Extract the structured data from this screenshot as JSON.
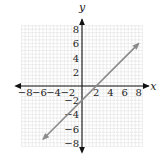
{
  "chart_data": {
    "type": "line",
    "title": "",
    "xlabel": "x",
    "ylabel": "y",
    "xlim": [
      -8.5,
      8.5
    ],
    "ylim": [
      -8.5,
      8.5
    ],
    "grid": true,
    "x_ticks": [
      -8,
      -6,
      -4,
      -2,
      2,
      4,
      6,
      8
    ],
    "y_ticks": [
      8,
      6,
      4,
      2,
      -2,
      -4,
      -6,
      -8
    ],
    "x_tick_labels": [
      "−8",
      "−6",
      "−4",
      "−2",
      "2",
      "4",
      "6",
      "8"
    ],
    "y_tick_labels": [
      "8",
      "6",
      "4",
      "2",
      "−2",
      "−4",
      "−6",
      "−8"
    ],
    "series": [
      {
        "name": "y = x − 2",
        "equation": "y = x - 2",
        "x": [
          -5.5,
          8
        ],
        "y": [
          -7.5,
          6
        ],
        "arrows": "both",
        "color": "#8a8a8a"
      }
    ]
  },
  "colors": {
    "axis": "#111111",
    "grid": "#bdbdbd",
    "line": "#8a8a8a"
  }
}
